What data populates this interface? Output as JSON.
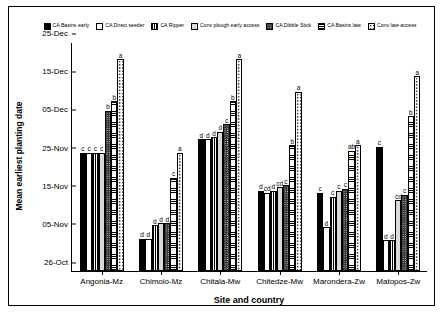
{
  "chart_data": {
    "type": "bar",
    "title": "",
    "xlabel": "Site and country",
    "ylabel": "Mean earliest planting date",
    "categories": [
      "Angonia-Mz",
      "Chimoio-Mz",
      "Chitala-Mw",
      "Chitedze-Mw",
      "Marondera-Zw",
      "Matopos-Zw"
    ],
    "ytick_labels": [
      "26-Oct",
      "05-Nov",
      "15-Nov",
      "25-Nov",
      "05-Dec",
      "15-Dec",
      "25-Dec"
    ],
    "ylim": [
      0,
      60
    ],
    "ytick_values": [
      0,
      10,
      20,
      30,
      40,
      50,
      60
    ],
    "grid": false,
    "legend_position": "top",
    "series": [
      {
        "name": "CA Basins early",
        "fill": "f-solid",
        "values": [
          31.0,
          8.5,
          34.5,
          21.0,
          20.5,
          32.5
        ],
        "labels": [
          "c",
          "d",
          "d",
          "d",
          "c",
          "c"
        ]
      },
      {
        "name": "CA Direct seeder",
        "fill": "f-white",
        "values": [
          31.0,
          8.5,
          34.5,
          20.5,
          11.5,
          8.0
        ],
        "labels": [
          "c",
          "d",
          "d",
          "cd",
          "d",
          "d"
        ]
      },
      {
        "name": "CA Ripper",
        "fill": "f-vgrid",
        "values": [
          31.0,
          12.0,
          35.0,
          21.0,
          19.5,
          8.0
        ],
        "labels": [
          "c",
          "d",
          "d",
          "d",
          "c",
          "d"
        ]
      },
      {
        "name": "Conv plough early access",
        "fill": "f-lgray",
        "values": [
          31.0,
          12.5,
          36.5,
          22.0,
          21.0,
          18.5
        ],
        "labels": [
          "c",
          "d",
          "d",
          "cd",
          "c",
          "cd"
        ]
      },
      {
        "name": "CA Dibble Stick",
        "fill": "f-dots",
        "values": [
          42.0,
          12.5,
          38.5,
          22.5,
          21.5,
          20.0
        ],
        "labels": [
          "b",
          "d",
          "c",
          "c",
          "c",
          "c"
        ]
      },
      {
        "name": "CA Basins late",
        "fill": "f-hgrid",
        "values": [
          44.5,
          24.5,
          44.5,
          33.0,
          31.5,
          40.5
        ],
        "labels": [
          "b",
          "c",
          "b",
          "b",
          "ab",
          "b"
        ]
      },
      {
        "name": "Conv late access",
        "fill": "f-sparse",
        "values": [
          55.5,
          31.0,
          55.5,
          47.0,
          33.0,
          51.0
        ],
        "labels": [
          "a",
          "a",
          "a",
          "a",
          "a",
          "a"
        ]
      }
    ]
  }
}
